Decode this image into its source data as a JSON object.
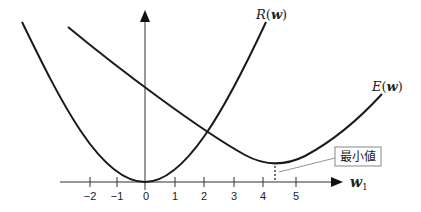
{
  "diagram": {
    "curves": [
      {
        "id": "R",
        "label": "R(w)",
        "label_func": "R",
        "label_arg": "w"
      },
      {
        "id": "E",
        "label": "E(w)",
        "label_func": "E",
        "label_arg": "w"
      }
    ],
    "x_axis": {
      "label": "w",
      "label_subscript": "1",
      "ticks": [
        {
          "value": "−2",
          "x": 90
        },
        {
          "value": "−1",
          "x": 117
        },
        {
          "value": "0",
          "x": 145
        },
        {
          "value": "1",
          "x": 175
        },
        {
          "value": "2",
          "x": 204
        },
        {
          "value": "3",
          "x": 234
        },
        {
          "value": "4",
          "x": 263
        },
        {
          "value": "5",
          "x": 296
        }
      ]
    },
    "annotation": {
      "text": "最小値"
    },
    "colors": {
      "line": "#1a1a1a",
      "axis": "#333333",
      "box_border": "#888888"
    }
  }
}
